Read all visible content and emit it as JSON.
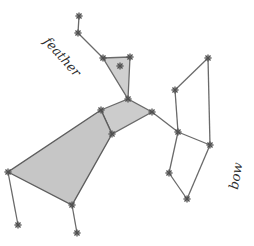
{
  "labels": {
    "feather": "feather",
    "bow": "bow"
  },
  "colors": {
    "line": "#6a6a6a",
    "fill": "#c9c9c9",
    "star": "#505050",
    "text": "#2e2e2e"
  },
  "stars": [
    {
      "x": 79,
      "y": 16
    },
    {
      "x": 78,
      "y": 33
    },
    {
      "x": 103,
      "y": 58
    },
    {
      "x": 130,
      "y": 57
    },
    {
      "x": 120,
      "y": 66
    },
    {
      "x": 128,
      "y": 99
    },
    {
      "x": 101,
      "y": 110
    },
    {
      "x": 112,
      "y": 134
    },
    {
      "x": 152,
      "y": 112
    },
    {
      "x": 208,
      "y": 58
    },
    {
      "x": 175,
      "y": 90
    },
    {
      "x": 178,
      "y": 132
    },
    {
      "x": 210,
      "y": 145
    },
    {
      "x": 169,
      "y": 173
    },
    {
      "x": 187,
      "y": 199
    },
    {
      "x": 8,
      "y": 172
    },
    {
      "x": 18,
      "y": 225
    },
    {
      "x": 72,
      "y": 205
    },
    {
      "x": 77,
      "y": 233
    }
  ]
}
